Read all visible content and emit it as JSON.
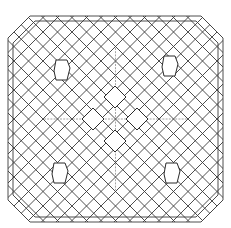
{
  "figure": {
    "title": "",
    "colors": {
      "background": "#ffffff",
      "line": "#3a3a3a"
    },
    "outline": {
      "x1": 8,
      "y1": 16,
      "x2": 223,
      "y2": 222,
      "corner_cut": 22,
      "inner_offset": 5
    },
    "lattice": {
      "spacing": 14.5,
      "cx": 115.5,
      "cy": 119
    },
    "leaf_shapes": [
      {
        "cx": 62,
        "cy": 70
      },
      {
        "cx": 170,
        "cy": 66
      },
      {
        "cx": 60,
        "cy": 173
      },
      {
        "cx": 172,
        "cy": 173
      }
    ],
    "center_diamonds": [
      {
        "cx": 115,
        "cy": 97,
        "r": 11
      },
      {
        "cx": 93,
        "cy": 119,
        "r": 11
      },
      {
        "cx": 137,
        "cy": 119,
        "r": 11
      },
      {
        "cx": 115,
        "cy": 141,
        "r": 11
      }
    ]
  }
}
